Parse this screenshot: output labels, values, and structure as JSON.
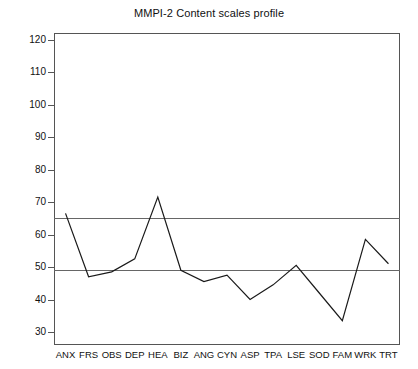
{
  "chart_data": {
    "type": "line",
    "title": "MMPI-2 Content scales profile",
    "xlabel": "",
    "ylabel": "",
    "categories": [
      "ANX",
      "FRS",
      "OBS",
      "DEP",
      "HEA",
      "BIZ",
      "ANG",
      "CYN",
      "ASP",
      "TPA",
      "LSE",
      "SOD",
      "FAM",
      "WRK",
      "TRT"
    ],
    "values": [
      66.5,
      47,
      48.5,
      52.5,
      71.5,
      49,
      45.5,
      47.5,
      40,
      44.5,
      50.5,
      42,
      33.5,
      58.5,
      51
    ],
    "series": [
      {
        "name": "T-score profile",
        "values": [
          66.5,
          47,
          48.5,
          52.5,
          71.5,
          49,
          45.5,
          47.5,
          40,
          44.5,
          50.5,
          42,
          33.5,
          58.5,
          51
        ]
      }
    ],
    "ylim": [
      26,
      122
    ],
    "yticks": [
      30,
      40,
      50,
      60,
      70,
      80,
      90,
      100,
      110,
      120
    ],
    "ytick_labels": [
      "30",
      "40",
      "50",
      "60",
      "70",
      "80",
      "90",
      "100",
      "110",
      "120"
    ],
    "grid": false,
    "legend": "none",
    "reference_lines": [
      {
        "name": "upper-clinical-cutoff",
        "value": 65
      },
      {
        "name": "mean-line",
        "value": 49
      }
    ],
    "line_color": "#1a1a1a",
    "reference_line_color": "#666666",
    "axis_color": "#555555",
    "background_color": "#ffffff"
  }
}
